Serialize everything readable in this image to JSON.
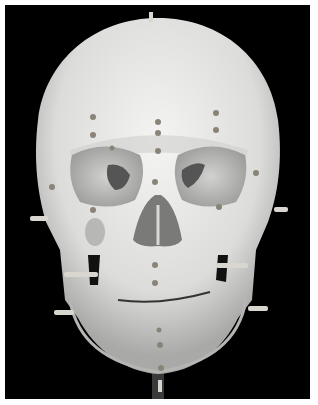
{
  "image": {
    "subject": "Frontal view of a human skull cast with tissue-depth marker pegs",
    "background_color": "#000000",
    "border_color": "#ffffff",
    "skull_color": "#e8e8e6",
    "shadow_color": "#8a8a88",
    "peg_color": "#d9d6d0"
  }
}
